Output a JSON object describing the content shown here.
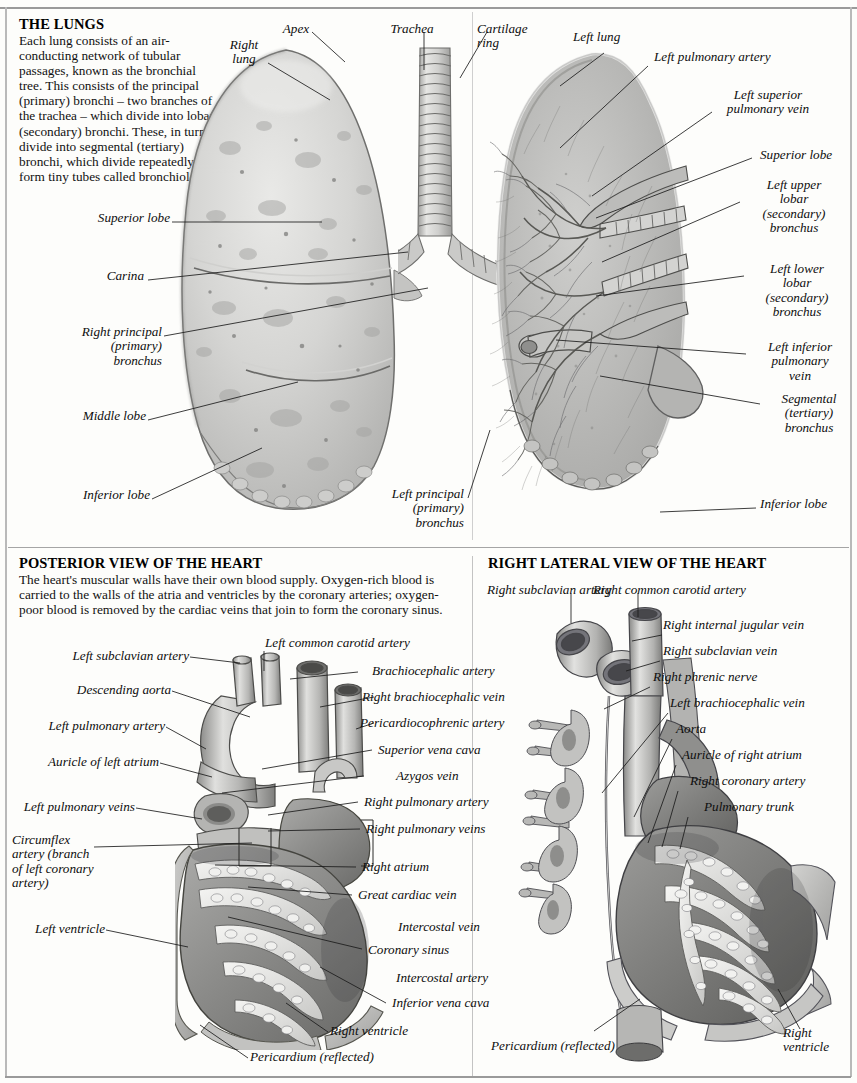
{
  "page": {
    "background": "#fdfdfb",
    "rule_color": "#9a9a9a"
  },
  "sections": {
    "lungs": {
      "heading": "THE LUNGS",
      "body": "Each lung consists of an air-conducting network of tubular passages, known as the bronchial tree. This consists of the principal (primary) bronchi – two branches of the trachea – which divide into lobar (secondary) bronchi. These, in turn, divide into segmental (tertiary) bronchi, which divide repeatedly to form tiny tubes called bronchioles.",
      "labels": {
        "apex": "Apex",
        "right_lung": "Right\nlung",
        "trachea": "Trachea",
        "cartilage_ring": "Cartilage\nring",
        "left_lung": "Left lung",
        "left_pulmonary_artery": "Left pulmonary artery",
        "left_superior_pulmonary_vein": "Left superior\npulmonary vein",
        "superior_lobe_right_panel": "Superior lobe",
        "left_upper_lobar_bronchus": "Left upper\nlobar\n(secondary)\nbronchus",
        "left_lower_lobar_bronchus": "Left lower\nlobar\n(secondary)\nbronchus",
        "left_inferior_pulmonary_vein": "Left inferior\npulmonary\nvein",
        "segmental_tertiary_bronchus": "Segmental\n(tertiary)\nbronchus",
        "inferior_lobe_right": "Inferior lobe",
        "superior_lobe_left": "Superior lobe",
        "carina": "Carina",
        "right_principal_bronchus": "Right principal\n(primary)\nbronchus",
        "middle_lobe": "Middle lobe",
        "inferior_lobe_left": "Inferior lobe",
        "left_principal_bronchus": "Left principal\n(primary)\nbronchus"
      }
    },
    "posterior_heart": {
      "heading": "POSTERIOR VIEW OF THE HEART",
      "body": "The heart's muscular walls have their own blood supply. Oxygen-rich blood is carried to the walls of the atria and ventricles by the coronary arteries; oxygen-poor blood is removed by the cardiac veins that join to form the coronary sinus.",
      "labels": {
        "left_subclavian_artery": "Left subclavian artery",
        "descending_aorta": "Descending aorta",
        "left_pulmonary_artery": "Left pulmonary artery",
        "auricle_of_left_atrium": "Auricle of left atrium",
        "left_pulmonary_veins": "Left pulmonary veins",
        "circumflex_artery": "Circumflex\nartery (branch\nof left coronary\nartery)",
        "left_ventricle": "Left ventricle",
        "left_common_carotid_artery": "Left common carotid artery",
        "brachiocephalic_artery": "Brachiocephalic artery",
        "right_brachiocephalic_vein": "Right brachiocephalic vein",
        "pericardiocophrenic_artery": "Pericardiocophrenic artery",
        "superior_vena_cava": "Superior vena cava",
        "azygos_vein": "Azygos vein",
        "right_pulmonary_artery": "Right pulmonary artery",
        "right_pulmonary_veins": "Right pulmonary veins",
        "right_atrium": "Right atrium",
        "great_cardiac_vein": "Great cardiac vein",
        "intercostal_vein": "Intercostal vein",
        "coronary_sinus": "Coronary sinus",
        "intercostal_artery": "Intercostal artery",
        "inferior_vena_cava": "Inferior vena cava",
        "right_ventricle": "Right ventricle",
        "pericardium_reflected": "Pericardium (reflected)"
      }
    },
    "lateral_heart": {
      "heading": "RIGHT LATERAL VIEW OF THE HEART",
      "labels": {
        "right_subclavian_artery": "Right subclavian artery",
        "right_common_carotid_artery": "Right common carotid artery",
        "right_internal_jugular_vein": "Right internal jugular vein",
        "right_subclavian_vein": "Right subclavian vein",
        "right_phrenic_nerve": "Right phrenic nerve",
        "left_brachiocephalic_vein": "Left brachiocephalic vein",
        "aorta": "Aorta",
        "auricle_of_right_atrium": "Auricle of right atrium",
        "right_coronary_artery": "Right coronary artery",
        "pulmonary_trunk": "Pulmonary trunk",
        "pericardium_reflected": "Pericardium (reflected)",
        "right_ventricle": "Right\nventricle"
      }
    }
  }
}
